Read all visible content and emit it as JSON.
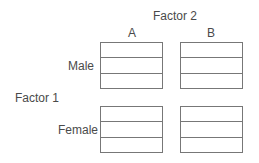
{
  "diagram": {
    "factor2_label": "Factor 2",
    "factor1_label": "Factor 1",
    "columns": [
      "A",
      "B"
    ],
    "rows": [
      "Male",
      "Female"
    ],
    "cells_per_box": 3
  }
}
